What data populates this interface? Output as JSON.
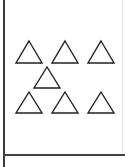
{
  "diagram": {
    "shape": "triangle",
    "style": "outline",
    "stroke_color": "#222222",
    "fill_color": "none",
    "rows": [
      {
        "row": 1,
        "count": 3
      },
      {
        "row": 2,
        "count": 1
      },
      {
        "row": 3,
        "count": 3
      }
    ],
    "total_count": 7
  }
}
